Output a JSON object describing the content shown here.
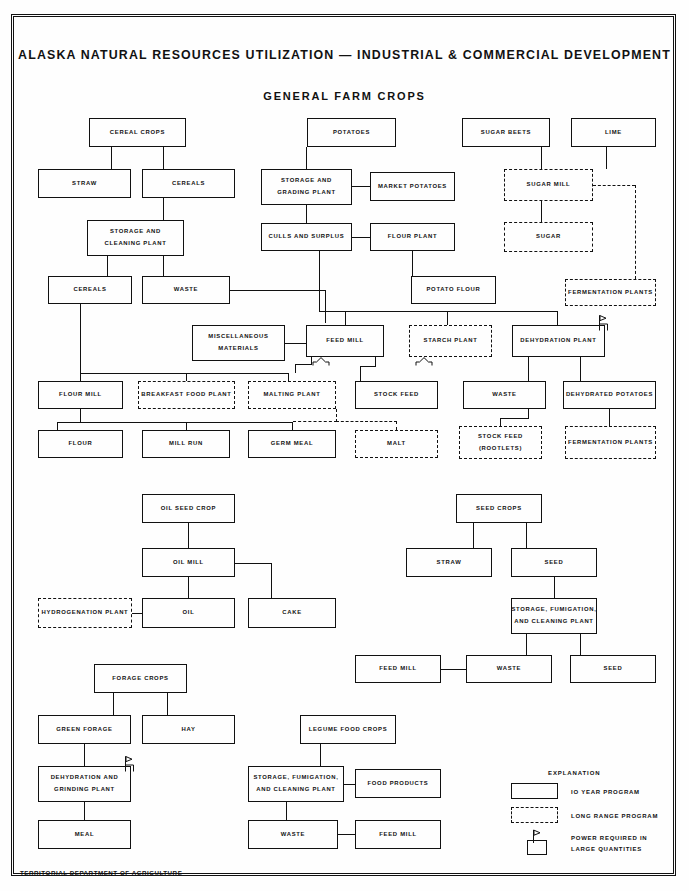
{
  "document": {
    "title": "ALASKA NATURAL RESOURCES UTILIZATION — INDUSTRIAL & COMMERCIAL DEVELOPMENT",
    "subtitle": "GENERAL FARM CROPS",
    "footer": "TERRITORIAL DEPARTMENT OF AGRICULTURE"
  },
  "legend": {
    "heading": "EXPLANATION",
    "items": [
      {
        "style": "solid",
        "label": "IO YEAR PROGRAM"
      },
      {
        "style": "dashed",
        "label": "LONG RANGE PROGRAM"
      },
      {
        "style": "flag",
        "label_line1": "POWER REQUIRED IN",
        "label_line2": "LARGE QUANTITIES"
      }
    ]
  },
  "boxes": {
    "cereal_crops": "CEREAL CROPS",
    "straw_top": "STRAW",
    "cereals_top": "CEREALS",
    "storage_cleaning_plant_l1": "STORAGE AND",
    "storage_cleaning_plant_l2": "CLEANING PLANT",
    "cereals_mid": "CEREALS",
    "waste_cereal": "WASTE",
    "flour_mill": "FLOUR MILL",
    "breakfast_food_plant": "BREAKFAST FOOD PLANT",
    "malting_plant": "MALTING PLANT",
    "flour": "FLOUR",
    "mill_run": "MILL RUN",
    "germ_meal": "GERM MEAL",
    "malt": "MALT",
    "potatoes": "POTATOES",
    "storage_grading_plant_l1": "STORAGE AND",
    "storage_grading_plant_l2": "GRADING PLANT",
    "market_potatoes": "MARKET POTATOES",
    "culls_and_surplus": "CULLS AND SURPLUS",
    "flour_plant": "FLOUR PLANT",
    "potato_flour": "POTATO FLOUR",
    "miscellaneous_materials_l1": "MISCELLANEOUS",
    "miscellaneous_materials_l2": "MATERIALS",
    "feed_mill_top": "FEED MILL",
    "starch_plant": "STARCH PLANT",
    "stock_feed": "STOCK FEED",
    "stock_feed_rootlets_l1": "STOCK FEED",
    "stock_feed_rootlets_l2": "(ROOTLETS)",
    "sugar_beets": "SUGAR BEETS",
    "lime": "LIME",
    "sugar_mill": "SUGAR MILL",
    "sugar": "SUGAR",
    "fermentation_plants_top": "FERMENTATION PLANTS",
    "dehydration_plant": "DEHYDRATION PLANT",
    "waste_potato": "WASTE",
    "dehydrated_potatoes": "DEHYDRATED POTATOES",
    "fermentation_plants_bottom": "FERMENTATION PLANTS",
    "oil_seed_crop": "OIL SEED CROP",
    "oil_mill": "OIL MILL",
    "hydrogenation_plant": "HYDROGENATION PLANT",
    "oil": "OIL",
    "cake": "CAKE",
    "seed_crops": "SEED CROPS",
    "straw_seed": "STRAW",
    "seed_upper": "SEED",
    "storage_fumigation_seed_l1": "STORAGE, FUMIGATION,",
    "storage_fumigation_seed_l2": "AND CLEANING PLANT",
    "feed_mill_seed": "FEED MILL",
    "waste_seed": "WASTE",
    "seed_lower": "SEED",
    "forage_crops": "FORAGE CROPS",
    "green_forage": "GREEN FORAGE",
    "hay": "HAY",
    "dehydration_grinding_l1": "DEHYDRATION AND",
    "dehydration_grinding_l2": "GRINDING PLANT",
    "meal": "MEAL",
    "legume_food_crops": "LEGUME FOOD CROPS",
    "storage_fumigation_legume_l1": "STORAGE, FUMIGATION,",
    "storage_fumigation_legume_l2": "AND CLEANING PLANT",
    "food_products": "FOOD PRODUCTS",
    "waste_legume": "WASTE",
    "feed_mill_legume": "FEED MILL"
  }
}
